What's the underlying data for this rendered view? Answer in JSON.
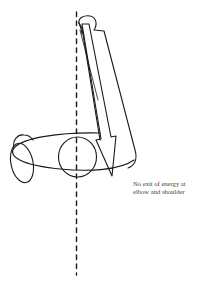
{
  "diagram": {
    "type": "biomechanics-sketch",
    "annotation": {
      "line1": "No exit of energy at",
      "line2": "elbow and shoulder"
    },
    "elements": {
      "axis_line": "vertical dashed reference line",
      "upper_limb": "elongated arm segment with rounded hand end",
      "force_arrow": "downward arrow along the arm",
      "torso_ellipse": "horizontal ellipse (shoulders)",
      "joint_circle": "circle at shoulder joint on axis",
      "small_oval": "small oval at left (opposite arm)"
    },
    "colors": {
      "stroke": "#1a1a1a",
      "text": "#444444",
      "background": "#ffffff"
    }
  }
}
